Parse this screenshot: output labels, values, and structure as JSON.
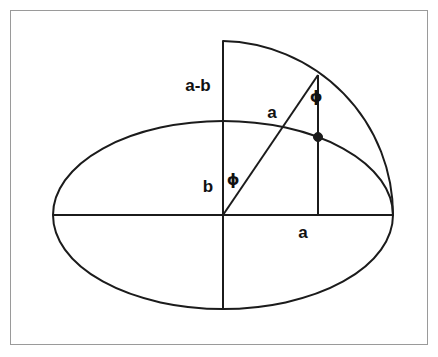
{
  "figure": {
    "background_color": "#ffffff",
    "frame_color": "#9a9a9a",
    "stroke_color": "#1b1b1b",
    "labels": [
      {
        "id": "a-minus-b",
        "text": "a-b",
        "x": 198,
        "y": 85
      },
      {
        "id": "a-radius",
        "text": "a",
        "x": 272,
        "y": 112
      },
      {
        "id": "phi-upper",
        "text": "ϕ",
        "x": 316,
        "y": 97
      },
      {
        "id": "b-semi-minor",
        "text": "b",
        "x": 208,
        "y": 186
      },
      {
        "id": "phi-lower",
        "text": "ϕ",
        "x": 233,
        "y": 180
      },
      {
        "id": "a-semi-major",
        "text": "a",
        "x": 303,
        "y": 232
      }
    ],
    "geometry": {
      "center": {
        "x": 223,
        "y": 215
      },
      "semi_major_a": 170,
      "semi_minor_b": 94,
      "circle_radius": 174,
      "ellipse_left_vertex": {
        "x": 53,
        "y": 215
      },
      "ellipse_right_vertex": {
        "x": 393,
        "y": 215
      },
      "ellipse_top": {
        "x": 223,
        "y": 121
      },
      "ellipse_bottom": {
        "x": 223,
        "y": 309
      },
      "circle_arc_top": {
        "x": 223,
        "y": 41
      },
      "circle_point": {
        "x": 318,
        "y": 75
      },
      "ellipse_point": {
        "x": 318,
        "y": 137
      },
      "dot_radius": 4.5
    }
  }
}
